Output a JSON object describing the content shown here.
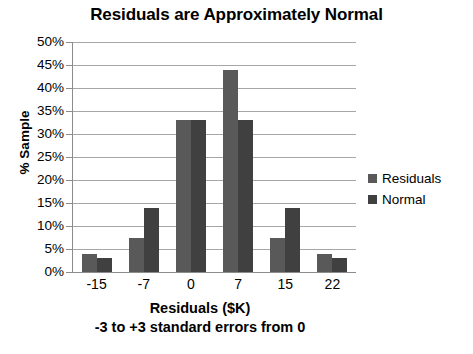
{
  "chart_data": {
    "type": "bar",
    "title": "Residuals are Approximately Normal",
    "xlabel": "Residuals ($K)",
    "xsublabel": "-3 to +3 standard errors from 0",
    "ylabel": "% Sample",
    "categories": [
      "-15",
      "-7",
      "0",
      "7",
      "15",
      "22"
    ],
    "series": [
      {
        "name": "Residuals",
        "color": "#595959",
        "values": [
          4,
          7.5,
          33,
          44,
          7.5,
          4
        ]
      },
      {
        "name": "Normal",
        "color": "#404040",
        "values": [
          3,
          14,
          33,
          33,
          14,
          3
        ]
      }
    ],
    "ylim": [
      0,
      50
    ],
    "ytick_labels": [
      "50%",
      "45%",
      "40%",
      "35%",
      "30%",
      "25%",
      "20%",
      "15%",
      "10%",
      "5%",
      "0%"
    ],
    "ytick_values": [
      50,
      45,
      40,
      35,
      30,
      25,
      20,
      15,
      10,
      5,
      0
    ],
    "grid": true,
    "legend_position": "right"
  }
}
